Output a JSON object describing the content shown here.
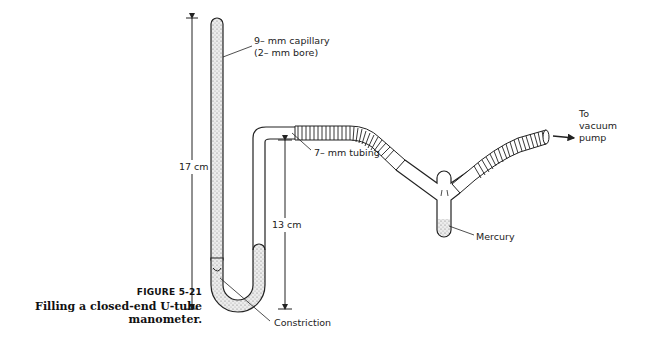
{
  "figure": {
    "number": "FIGURE 5-21",
    "caption": "Filling a closed-end U-tube manometer."
  },
  "labels": {
    "capillary_line1": "9– mm capillary",
    "capillary_line2": "(2– mm bore)",
    "height_total": "17 cm",
    "height_open": "13 cm",
    "tubing": "7– mm tubing",
    "mercury": "Mercury",
    "pump_line1": "To",
    "pump_line2": "vacuum",
    "pump_line3": "pump",
    "constriction": "Constriction"
  },
  "colors": {
    "line": "#222222",
    "fill_mercury": "#bdbdbd",
    "background": "#ffffff"
  }
}
